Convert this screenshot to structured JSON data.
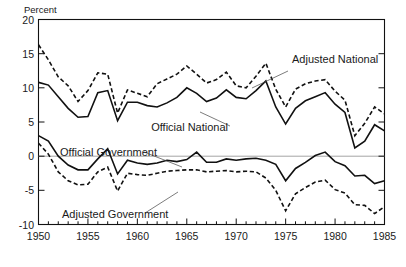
{
  "chart_data": {
    "type": "line",
    "title": "",
    "subtitle": "",
    "xlabel": "",
    "ylabel": "Percent",
    "unit_label": "Percent",
    "xlim": [
      1950,
      1985
    ],
    "ylim": [
      -10,
      20
    ],
    "grid": false,
    "zero_line": true,
    "legend_position": "inline-annotations",
    "x_tick_labels": [
      "1950",
      "1955",
      "1960",
      "1965",
      "1970",
      "1975",
      "1980",
      "1985"
    ],
    "x_tick_values": [
      1950,
      1955,
      1960,
      1965,
      1970,
      1975,
      1980,
      1985
    ],
    "x_minor_tick_interval": 1,
    "y_tick_labels": [
      "20",
      "15",
      "10",
      "5",
      "0",
      "-5",
      "-10"
    ],
    "y_tick_values": [
      20,
      15,
      10,
      5,
      0,
      -5,
      -10
    ],
    "x": [
      1950,
      1951,
      1952,
      1953,
      1954,
      1955,
      1956,
      1957,
      1958,
      1959,
      1960,
      1961,
      1962,
      1963,
      1964,
      1965,
      1966,
      1967,
      1968,
      1969,
      1970,
      1971,
      1972,
      1973,
      1974,
      1975,
      1976,
      1977,
      1978,
      1979,
      1980,
      1981,
      1982,
      1983,
      1984,
      1985
    ],
    "series": [
      {
        "name": "Adjusted National",
        "label": "Adjusted National",
        "style": "dashed",
        "color": "#111111",
        "values": [
          16.3,
          14.1,
          11.6,
          10.3,
          8.0,
          9.6,
          12.2,
          12.0,
          6.3,
          9.7,
          9.2,
          8.7,
          10.6,
          11.3,
          12.0,
          13.2,
          12.0,
          10.7,
          11.2,
          12.3,
          10.3,
          10.0,
          11.7,
          13.6,
          9.8,
          7.2,
          9.8,
          10.6,
          11.0,
          11.2,
          9.5,
          8.2,
          3.0,
          4.8,
          7.2,
          6.2
        ]
      },
      {
        "name": "Official National",
        "label": "Official National",
        "style": "solid",
        "color": "#111111",
        "values": [
          10.8,
          10.4,
          8.7,
          7.0,
          5.7,
          5.8,
          9.3,
          9.6,
          5.2,
          7.9,
          7.9,
          7.4,
          7.2,
          7.8,
          8.6,
          10.0,
          9.2,
          8.0,
          8.5,
          9.7,
          8.6,
          8.4,
          9.6,
          11.0,
          7.2,
          4.7,
          7.0,
          8.1,
          8.7,
          9.3,
          7.6,
          6.4,
          1.2,
          2.2,
          4.6,
          3.7
        ]
      },
      {
        "name": "Official Government",
        "label": "Official Government",
        "style": "solid",
        "color": "#111111",
        "values": [
          3.0,
          2.2,
          0.0,
          -1.3,
          -2.0,
          -2.0,
          -0.4,
          1.1,
          -2.6,
          -0.6,
          -1.0,
          -1.2,
          -1.0,
          -0.6,
          -0.8,
          -0.5,
          0.6,
          -0.9,
          -0.9,
          -0.4,
          -0.6,
          -0.4,
          -0.3,
          -0.6,
          -1.2,
          -3.6,
          -1.8,
          -0.9,
          0.1,
          0.6,
          -0.8,
          -1.4,
          -2.9,
          -2.8,
          -4.0,
          -3.6
        ]
      },
      {
        "name": "Adjusted Government",
        "label": "Adjusted Government",
        "style": "dashed",
        "color": "#111111",
        "values": [
          1.9,
          0.3,
          -2.3,
          -3.6,
          -4.2,
          -4.1,
          -2.3,
          -1.6,
          -5.1,
          -2.5,
          -2.7,
          -2.8,
          -2.5,
          -2.2,
          -2.1,
          -2.0,
          -2.0,
          -2.3,
          -2.2,
          -2.1,
          -2.3,
          -2.2,
          -2.3,
          -3.2,
          -5.0,
          -8.0,
          -5.5,
          -4.6,
          -3.8,
          -3.5,
          -4.9,
          -5.4,
          -7.1,
          -7.2,
          -8.4,
          -7.4
        ]
      }
    ],
    "annotations": [
      {
        "text": "Adjusted National",
        "x": 1974,
        "y": 15.5
      },
      {
        "text": "Official National",
        "x": 1967,
        "y": 5.5
      },
      {
        "text": "Official Government",
        "x": 1955.5,
        "y": 2.0
      },
      {
        "text": "Adjusted Government",
        "x": 1955.5,
        "y": -6.7
      }
    ]
  }
}
